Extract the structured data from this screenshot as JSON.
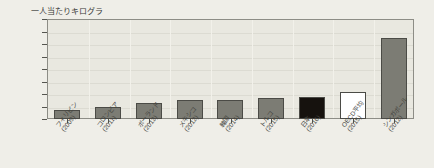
{
  "chart_data": {
    "type": "bar",
    "title": "",
    "ylabel": "一人当たりキログラ",
    "xlabel": "",
    "ylim": [
      0,
      1600
    ],
    "ytick_labels": [
      "1,600",
      "1,400",
      "1,200",
      "1,000",
      "800",
      "600",
      "400",
      "200",
      "0"
    ],
    "ytick_values": [
      1600,
      1400,
      1200,
      1000,
      800,
      600,
      400,
      200,
      0
    ],
    "grid": true,
    "legend": "none",
    "categories": [
      "フィリピン(2009)",
      "コロンビア(2011)",
      "ポーランド(2013)",
      "メキシコ(2012)",
      "韓国(2014)",
      "トルコ(2015)",
      "日本(2016)",
      "OECD平均(2015)",
      "シンガポール(2012)"
    ],
    "category_names": [
      "フィリピン",
      "コロンビア",
      "ポーランド",
      "メキシコ",
      "韓国",
      "トルコ",
      "日本",
      "OECD平均",
      "シンガポール"
    ],
    "category_years": [
      "(2009)",
      "(2011)",
      "(2013)",
      "(2012)",
      "(2014)",
      "(2015)",
      "(2016)",
      "(2015)",
      "(2012)"
    ],
    "values": [
      140,
      190,
      260,
      300,
      300,
      340,
      360,
      440,
      1300
    ],
    "bar_colors": [
      "#7c7c74",
      "#7c7c74",
      "#7c7c74",
      "#7c7c74",
      "#7c7c74",
      "#7c7c74",
      "#16120e",
      "#ffffff",
      "#7c7c74"
    ],
    "colors": {
      "default_bar": "#7c7c74",
      "highlight_bar": "#16120e",
      "average_bar": "#ffffff",
      "plot_background": "#e9e8e0",
      "page_background": "#efeee8",
      "axis_line": "#8d8d86",
      "text": "#38383a"
    }
  }
}
